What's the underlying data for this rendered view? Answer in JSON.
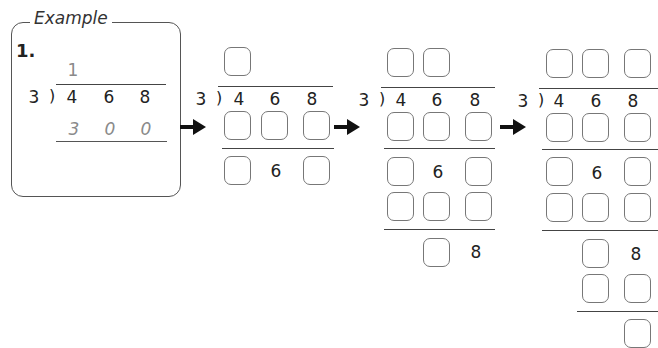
{
  "example": {
    "title": "Example",
    "problem_number": "1.",
    "divisor": "3",
    "dividend_digits": [
      "4",
      "6",
      "8"
    ],
    "quotient_digit": "1",
    "partial_product_digits": [
      "3",
      "0",
      "0"
    ]
  },
  "stages": [
    {
      "divisor": "3",
      "dividend_digits": [
        "4",
        "6",
        "8"
      ],
      "remainder_digit_1": "6"
    },
    {
      "divisor": "3",
      "dividend_digits": [
        "4",
        "6",
        "8"
      ],
      "remainder_digit_1": "6",
      "remainder_digit_2": "8"
    },
    {
      "divisor": "3",
      "dividend_digits": [
        "4",
        "6",
        "8"
      ],
      "remainder_digit_1": "6",
      "remainder_digit_2": "8"
    }
  ],
  "icons": {
    "arrow": "right-arrow-icon"
  }
}
